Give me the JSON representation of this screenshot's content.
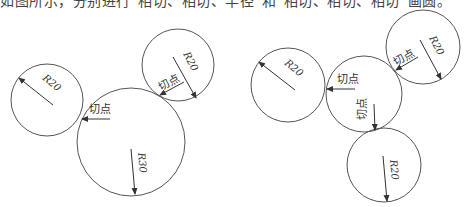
{
  "caption": "如图所示，分别进行“相切、相切、半径”和“相切、相切、相切”画圆。",
  "labels": {
    "tangent": "切点",
    "r20": "R20",
    "r30": "R30"
  },
  "left_figure": {
    "circles": [
      {
        "name": "small-left",
        "cx": 47,
        "cy": 100,
        "r": 36,
        "label": "R20"
      },
      {
        "name": "small-top",
        "cx": 178,
        "cy": 65,
        "r": 36,
        "label": "R20"
      },
      {
        "name": "large",
        "cx": 131,
        "cy": 142,
        "r": 54,
        "label": "R30"
      }
    ],
    "tangent_points": 2
  },
  "right_figure": {
    "circles": [
      {
        "name": "left",
        "cx": 288,
        "cy": 85,
        "r": 37,
        "label": "R20"
      },
      {
        "name": "top",
        "cx": 423,
        "cy": 47,
        "r": 37,
        "label": "R20"
      },
      {
        "name": "bottom",
        "cx": 384,
        "cy": 165,
        "r": 37,
        "label": "R20"
      },
      {
        "name": "middle",
        "cx": 364,
        "cy": 94,
        "r": 38,
        "label": ""
      }
    ],
    "tangent_points": 3
  },
  "colors": {
    "stroke": "#555555",
    "text": "#333333"
  }
}
